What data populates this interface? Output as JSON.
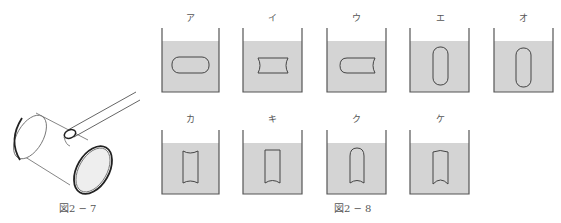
{
  "figure_2_7": {
    "caption": "図2 − 7",
    "description": "cylinder with membrane-covered ends and a tube inserted into a hole on top"
  },
  "figure_2_8": {
    "caption": "図2 − 8",
    "containers": [
      {
        "label": "ア",
        "shape": "horizontal-rounded-capsule"
      },
      {
        "label": "イ",
        "shape": "horizontal-both-ends-concave"
      },
      {
        "label": "ウ",
        "shape": "horizontal-left-rounded-right-concave"
      },
      {
        "label": "エ",
        "shape": "vertical-rounded-capsule"
      },
      {
        "label": "オ",
        "shape": "vertical-rounded-capsule"
      },
      {
        "label": "カ",
        "shape": "vertical-both-ends-concave"
      },
      {
        "label": "キ",
        "shape": "vertical-top-flat-bottom-concave"
      },
      {
        "label": "ク",
        "shape": "vertical-top-rounded-bottom-concave"
      },
      {
        "label": "ケ",
        "shape": "vertical-top-rounded-bottom-concave"
      }
    ]
  },
  "colors": {
    "liquid": "#d4d4d4",
    "outline": "#555555",
    "background": "#ffffff"
  }
}
